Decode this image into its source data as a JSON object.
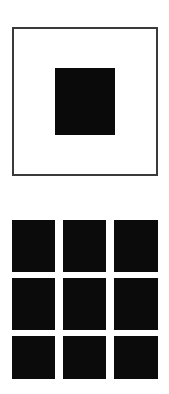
{
  "image": {
    "background_color": "#ffffff",
    "width": 169,
    "height": 394
  },
  "figures": [
    {
      "id": "framed-square",
      "type": "square-outline-with-centered-fill",
      "border_color": "#3a3a3a",
      "border_width": 2,
      "fill_color": "#ffffff",
      "inner": {
        "shape": "square",
        "fill_color": "#0a0a0a"
      }
    },
    {
      "id": "square-grid",
      "type": "grid",
      "rows": 3,
      "columns": 3,
      "cell_color": "#0b0b0b",
      "gap_color": "#ffffff",
      "cells": [
        {
          "row": 1,
          "column": 1
        },
        {
          "row": 1,
          "column": 2
        },
        {
          "row": 1,
          "column": 3
        },
        {
          "row": 2,
          "column": 1
        },
        {
          "row": 2,
          "column": 2
        },
        {
          "row": 2,
          "column": 3
        },
        {
          "row": 3,
          "column": 1
        },
        {
          "row": 3,
          "column": 2
        },
        {
          "row": 3,
          "column": 3
        }
      ]
    }
  ]
}
